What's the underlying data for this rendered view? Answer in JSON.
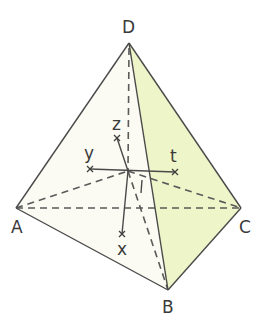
{
  "figure": {
    "colors": {
      "face_front_left": "#fbfbf3",
      "face_front_right": "#eef5c9",
      "edge": "#4a4a4a",
      "label": "#3a3a3a"
    },
    "vertices": {
      "A": {
        "label": "A",
        "x": 16,
        "y": 208
      },
      "B": {
        "label": "B",
        "x": 168,
        "y": 290
      },
      "C": {
        "label": "C",
        "x": 241,
        "y": 208
      },
      "D": {
        "label": "D",
        "x": 129,
        "y": 43
      }
    },
    "center": {
      "label": "I",
      "x": 128,
      "y": 171
    },
    "lines": {
      "x": {
        "label": "x",
        "x": 122,
        "y": 234
      },
      "y": {
        "label": "y",
        "x": 90,
        "y": 169
      },
      "z": {
        "label": "z",
        "x": 117,
        "y": 138
      },
      "t": {
        "label": "t",
        "x": 175,
        "y": 172
      }
    },
    "solid_edges": [
      "DA",
      "DB",
      "DC",
      "AB",
      "BC"
    ],
    "hidden_edges": [
      "AC",
      "AI",
      "IC",
      "DI",
      "IB"
    ]
  }
}
